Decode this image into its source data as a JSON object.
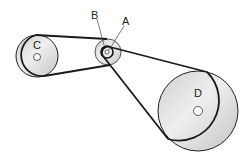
{
  "diagram": {
    "type": "belt-pulley-system",
    "labels": {
      "a": "A",
      "b": "B",
      "c": "C",
      "d": "D"
    },
    "colors": {
      "belt": "#1a1a1a",
      "pulley_fill": "#d9d9d9",
      "pulley_fill_light": "#eeeeee",
      "outline": "#222222"
    }
  }
}
